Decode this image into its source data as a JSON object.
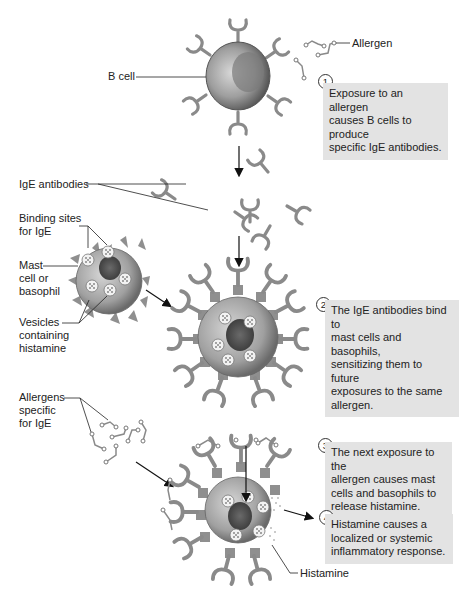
{
  "figure": {
    "colors": {
      "antibody": "#8a8a8a",
      "cell_body": "#9a9a9a",
      "nucleus": "#555555",
      "step_box": "#e3e3e3",
      "arrow": "#111111"
    }
  },
  "labels": {
    "allergen": "Allergen",
    "b_cell": "B cell",
    "ige_antibodies": "IgE antibodies",
    "binding_sites": "Binding sites\nfor IgE",
    "mast_cell": "Mast\ncell or\nbasophil",
    "vesicles": "Vesicles\ncontaining\nhistamine",
    "allergens_specific": "Allergens\nspecific\nfor IgE",
    "histamine": "Histamine"
  },
  "steps": [
    {
      "number": "1",
      "text": "Exposure to an allergen\ncauses B cells to produce\nspecific IgE antibodies."
    },
    {
      "number": "2",
      "text": "The IgE antibodies bind to\nmast cells and basophils,\nsensitizing them to future\nexposures to the same\nallergen."
    },
    {
      "number": "3",
      "text": "The next exposure to the\nallergen causes mast\ncells and basophils to\nrelease histamine."
    },
    {
      "number": "4",
      "text": "Histamine causes a\nlocalized or systemic\ninflammatory response."
    }
  ]
}
